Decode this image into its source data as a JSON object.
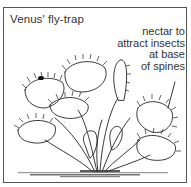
{
  "figure": {
    "title": "Venus' fly-trap",
    "annotation": {
      "lines": [
        "nectar to",
        "attract insects",
        "at base",
        "of spines"
      ]
    },
    "illustration": "venus-flytrap-plant-line-drawing"
  }
}
